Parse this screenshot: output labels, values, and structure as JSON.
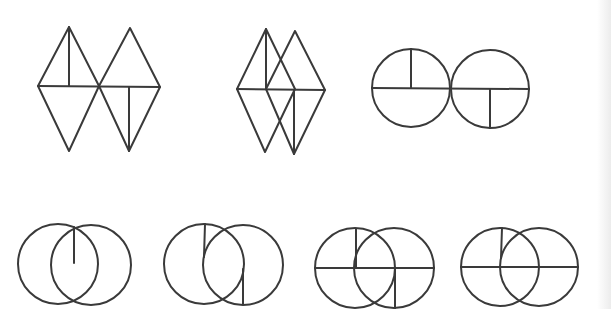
{
  "figure": {
    "stroke_color": "#3a3a3a",
    "background": "#ffffff",
    "rows": [
      {
        "row": "top",
        "items": [
          {
            "id": "fig-1",
            "description": "two rhombi touching at a vertex; left has vertical segment in upper half, right has vertical segment in lower half",
            "polygons": [
              [
                [
                  69,
                  27
                ],
                [
                  38,
                  86
                ],
                [
                  69,
                  151
                ],
                [
                  99,
                  86
                ]
              ],
              [
                [
                  130,
                  28
                ],
                [
                  99,
                  86
                ],
                [
                  129,
                  151
                ],
                [
                  160,
                  87
                ]
              ]
            ],
            "lines": [
              [
                [
                  38,
                  86
                ],
                [
                  160,
                  87
                ]
              ],
              [
                [
                  69,
                  27
                ],
                [
                  69,
                  86
                ]
              ],
              [
                [
                  129,
                  87
                ],
                [
                  129,
                  151
                ]
              ]
            ],
            "circles": []
          },
          {
            "id": "fig-2",
            "description": "two overlapping rhombi; vertical segment in upper half of left, lower half of right",
            "polygons": [
              [
                [
                  266,
                  29
                ],
                [
                  237,
                  89
                ],
                [
                  265,
                  152
                ],
                [
                  295,
                  89
                ]
              ],
              [
                [
                  295,
                  31
                ],
                [
                  266,
                  89
                ],
                [
                  294,
                  154
                ],
                [
                  325,
                  90
                ]
              ]
            ],
            "lines": [
              [
                [
                  237,
                  89
                ],
                [
                  325,
                  90
                ]
              ],
              [
                [
                  266,
                  29
                ],
                [
                  266,
                  89
                ]
              ],
              [
                [
                  294,
                  90
                ],
                [
                  294,
                  154
                ]
              ]
            ],
            "circles": []
          },
          {
            "id": "fig-3",
            "description": "two tangent circles; each with horizontal diameter; left with upward radius, right with downward radius",
            "polygons": [],
            "lines": [
              [
                [
                  372,
                  88
                ],
                [
                  529,
                  89
                ]
              ],
              [
                [
                  411,
                  49
                ],
                [
                  411,
                  88
                ]
              ],
              [
                [
                  490,
                  89
                ],
                [
                  490,
                  128
                ]
              ]
            ],
            "circles": [
              {
                "cx": 411,
                "cy": 88,
                "r": 39
              },
              {
                "cx": 490,
                "cy": 89,
                "r": 39
              }
            ]
          }
        ]
      },
      {
        "row": "bottom",
        "items": [
          {
            "id": "fig-4",
            "description": "two overlapping circles with a vertical segment from top intersection to middle",
            "polygons": [],
            "lines": [
              [
                [
                  74,
                  227
                ],
                [
                  74,
                  263
                ]
              ]
            ],
            "circles": [
              {
                "cx": 58,
                "cy": 264,
                "r": 40
              },
              {
                "cx": 91,
                "cy": 265,
                "r": 40
              }
            ]
          },
          {
            "id": "fig-5",
            "description": "two overlapping circles with a vertical segment in upper left and lower right",
            "polygons": [],
            "lines": [
              [
                [
                  205,
                  224
                ],
                [
                  204,
                  257
                ]
              ],
              [
                [
                  243,
                  269
                ],
                [
                  243,
                  304
                ]
              ]
            ],
            "circles": [
              {
                "cx": 204,
                "cy": 264,
                "r": 40
              },
              {
                "cx": 243,
                "cy": 265,
                "r": 40
              }
            ]
          },
          {
            "id": "fig-6",
            "description": "two overlapping circles with horizontal line, upward segment on left, downward segment on right",
            "polygons": [],
            "lines": [
              [
                [
                  315,
                  268
                ],
                [
                  434,
                  268
                ]
              ],
              [
                [
                  356,
                  229
                ],
                [
                  356,
                  268
                ]
              ],
              [
                [
                  395,
                  268
                ],
                [
                  395,
                  309
                ]
              ]
            ],
            "circles": [
              {
                "cx": 355,
                "cy": 268,
                "r": 40
              },
              {
                "cx": 394,
                "cy": 268,
                "r": 40
              }
            ]
          },
          {
            "id": "fig-7",
            "description": "two overlapping circles with horizontal line and short upward segment on left",
            "polygons": [],
            "lines": [
              [
                [
                  461,
                  267
                ],
                [
                  578,
                  267
                ]
              ],
              [
                [
                  502,
                  228
                ],
                [
                  501,
                  258
                ]
              ]
            ],
            "circles": [
              {
                "cx": 500,
                "cy": 267,
                "r": 39
              },
              {
                "cx": 539,
                "cy": 267,
                "r": 39
              }
            ]
          }
        ]
      }
    ]
  }
}
